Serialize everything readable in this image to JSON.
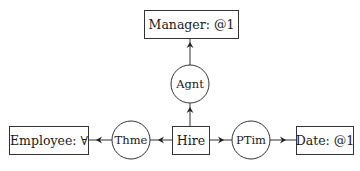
{
  "diagram": {
    "type": "conceptual-graph",
    "concepts": [
      {
        "id": "manager",
        "label": "Manager: @1"
      },
      {
        "id": "hire",
        "label": "Hire"
      },
      {
        "id": "employee",
        "label": "Employee: ∀"
      },
      {
        "id": "date",
        "label": "Date: @1"
      }
    ],
    "relations": [
      {
        "id": "agnt",
        "label": "Agnt"
      },
      {
        "id": "thme",
        "label": "Thme"
      },
      {
        "id": "ptim",
        "label": "PTim"
      }
    ],
    "edges": [
      {
        "from": "hire",
        "to": "agnt"
      },
      {
        "from": "agnt",
        "to": "manager"
      },
      {
        "from": "hire",
        "to": "thme"
      },
      {
        "from": "thme",
        "to": "employee"
      },
      {
        "from": "hire",
        "to": "ptim"
      },
      {
        "from": "ptim",
        "to": "date"
      }
    ],
    "colors": {
      "stroke": "#333333",
      "background": "#ffffff",
      "text": "#1a1a1a"
    }
  }
}
